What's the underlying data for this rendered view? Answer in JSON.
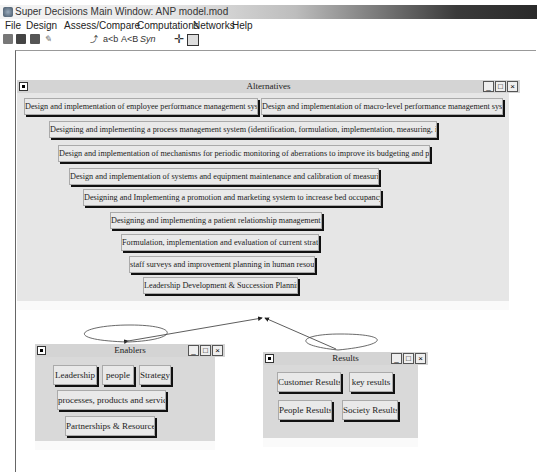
{
  "window": {
    "title": "Super Decisions Main Window: ANP model.mod"
  },
  "menubar": [
    "File",
    "Design",
    "Assess/Compare",
    "Computations",
    "Networks",
    "Help"
  ],
  "toolbar": {
    "icons": [
      "open-icon",
      "save-icon",
      "print-icon",
      "edit-icon"
    ],
    "text_buttons": [
      "a<b",
      "A<B",
      "Syn"
    ],
    "node_icon": "node-connect-icon",
    "cluster_icon": "cluster-icon"
  },
  "clusters": {
    "alternatives": {
      "title": "Alternatives",
      "nodes": [
        "Design and implementation of employee performance management system",
        "Design and implementation of macro-level performance management system",
        "Designing and implementing a process management system  (identification, formulation, implementation, measuring, improve)",
        "Design and implementation of mechanisms for periodic monitoring of aberrations to improve its budgeting and planning",
        "Design and implementation of systems and equipment maintenance and calibration of measuring instruments",
        "Designing and Implementing a promotion and marketing system to  increase bed occupancy rate",
        "Designing and implementing a patient relationship management System",
        "Formulation, implementation and evaluation of current strategies",
        "staff surveys and improvement planning in human resources",
        "Leadership Development & Succession Planning"
      ]
    },
    "enablers": {
      "title": "Enablers",
      "nodes": [
        "Leadership",
        "people",
        "Strategy",
        "processes, products and services",
        "Partnerships & Resources"
      ]
    },
    "results": {
      "title": "Results",
      "nodes": [
        "Customer Results",
        "key results",
        "People Results",
        "Society Results"
      ]
    }
  },
  "window_controls": {
    "minimize": "_",
    "maximize": "□",
    "close": "×"
  }
}
